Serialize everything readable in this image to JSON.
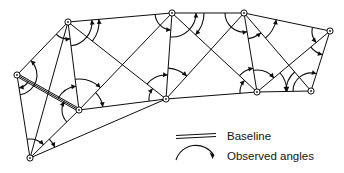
{
  "figure": {
    "type": "triangulation-network-diagram",
    "title": "",
    "background_color": "#ffffff",
    "line_color": "#0d0d0d",
    "stations": [
      {
        "id": "A",
        "name": "left-west-station",
        "x": 17,
        "y": 75
      },
      {
        "id": "B",
        "name": "top-left-station",
        "x": 68,
        "y": 22
      },
      {
        "id": "C",
        "name": "mid-left-lower-station",
        "x": 79,
        "y": 110
      },
      {
        "id": "D",
        "name": "bottom-south-station",
        "x": 30,
        "y": 158
      },
      {
        "id": "E",
        "name": "top-center-station",
        "x": 172,
        "y": 13
      },
      {
        "id": "F",
        "name": "mid-center-lower-station",
        "x": 166,
        "y": 99
      },
      {
        "id": "G",
        "name": "top-right-inner-station",
        "x": 244,
        "y": 13
      },
      {
        "id": "H",
        "name": "lower-right-inner-station",
        "x": 257,
        "y": 92
      },
      {
        "id": "I",
        "name": "top-east-station",
        "x": 330,
        "y": 31
      },
      {
        "id": "J",
        "name": "lower-east-station",
        "x": 311,
        "y": 91
      }
    ],
    "baseline": {
      "from": "A",
      "to": "C",
      "style": "double-line"
    },
    "edges": [
      {
        "from": "A",
        "to": "B"
      },
      {
        "from": "A",
        "to": "C"
      },
      {
        "from": "A",
        "to": "D"
      },
      {
        "from": "B",
        "to": "C"
      },
      {
        "from": "B",
        "to": "D"
      },
      {
        "from": "B",
        "to": "E"
      },
      {
        "from": "B",
        "to": "F"
      },
      {
        "from": "C",
        "to": "D"
      },
      {
        "from": "C",
        "to": "E"
      },
      {
        "from": "C",
        "to": "F"
      },
      {
        "from": "D",
        "to": "F"
      },
      {
        "from": "E",
        "to": "F"
      },
      {
        "from": "E",
        "to": "G"
      },
      {
        "from": "E",
        "to": "H"
      },
      {
        "from": "F",
        "to": "G"
      },
      {
        "from": "F",
        "to": "H"
      },
      {
        "from": "G",
        "to": "H"
      },
      {
        "from": "G",
        "to": "I"
      },
      {
        "from": "G",
        "to": "J"
      },
      {
        "from": "H",
        "to": "I"
      },
      {
        "from": "H",
        "to": "J"
      },
      {
        "from": "I",
        "to": "J"
      }
    ],
    "observed_angles": [
      {
        "vertex": "B",
        "from": "A",
        "to": "C",
        "radius": 17
      },
      {
        "vertex": "B",
        "from": "C",
        "to": "E",
        "radius": 24
      },
      {
        "vertex": "B",
        "from": "F",
        "to": "E",
        "radius": 31
      },
      {
        "vertex": "A",
        "from": "D",
        "to": "B",
        "radius": 20
      },
      {
        "vertex": "A",
        "from": "C",
        "to": "D",
        "radius": 13
      },
      {
        "vertex": "C",
        "from": "D",
        "to": "A",
        "radius": 17
      },
      {
        "vertex": "C",
        "from": "A",
        "to": "B",
        "radius": 24
      },
      {
        "vertex": "C",
        "from": "B",
        "to": "E",
        "radius": 31
      },
      {
        "vertex": "C",
        "from": "E",
        "to": "F",
        "radius": 24
      },
      {
        "vertex": "D",
        "from": "A",
        "to": "C",
        "radius": 19
      },
      {
        "vertex": "D",
        "from": "C",
        "to": "F",
        "radius": 27
      },
      {
        "vertex": "E",
        "from": "B",
        "to": "F",
        "radius": 17
      },
      {
        "vertex": "E",
        "from": "F",
        "to": "G",
        "radius": 24
      },
      {
        "vertex": "E",
        "from": "G",
        "to": "H",
        "radius": 32
      },
      {
        "vertex": "F",
        "from": "C",
        "to": "B",
        "radius": 17
      },
      {
        "vertex": "F",
        "from": "B",
        "to": "E",
        "radius": 24
      },
      {
        "vertex": "F",
        "from": "E",
        "to": "G",
        "radius": 31
      },
      {
        "vertex": "G",
        "from": "E",
        "to": "H",
        "radius": 19
      },
      {
        "vertex": "G",
        "from": "H",
        "to": "J",
        "radius": 26
      },
      {
        "vertex": "G",
        "from": "J",
        "to": "I",
        "radius": 33
      },
      {
        "vertex": "H",
        "from": "F",
        "to": "E",
        "radius": 17
      },
      {
        "vertex": "H",
        "from": "E",
        "to": "G",
        "radius": 24
      },
      {
        "vertex": "H",
        "from": "G",
        "to": "I",
        "radius": 22
      },
      {
        "vertex": "H",
        "from": "I",
        "to": "J",
        "radius": 30
      },
      {
        "vertex": "I",
        "from": "G",
        "to": "H",
        "radius": 18
      },
      {
        "vertex": "I",
        "from": "H",
        "to": "J",
        "radius": 25
      },
      {
        "vertex": "J",
        "from": "H",
        "to": "I",
        "radius": 18
      },
      {
        "vertex": "J",
        "from": "G",
        "to": "H",
        "radius": 25
      }
    ]
  },
  "legend": {
    "position": "bottom-right",
    "items": [
      {
        "key": "baseline",
        "symbol": "double-line-symbol",
        "label": "Baseline"
      },
      {
        "key": "observed_angles",
        "symbol": "arc-arrow-symbol",
        "label": "Observed angles"
      }
    ]
  }
}
